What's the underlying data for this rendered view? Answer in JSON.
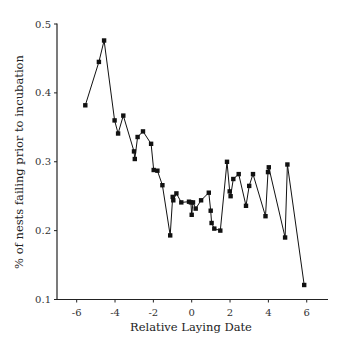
{
  "chart_data": {
    "type": "line",
    "title": "",
    "xlabel": "Relative Laying Date",
    "ylabel": "% of nests failing prior to incubation",
    "xlim": [
      -7,
      7
    ],
    "ylim": [
      0.1,
      0.5
    ],
    "xticks": [
      -6,
      -4,
      -2,
      0,
      2,
      4,
      6
    ],
    "xtick_labels": [
      "-6",
      "-4",
      "-2",
      "0",
      "2",
      "4",
      "6"
    ],
    "yticks": [
      0.1,
      0.2,
      0.3,
      0.4,
      0.5
    ],
    "ytick_labels": [
      "0.1",
      "0.2",
      "0.3",
      "0.4",
      "0.5"
    ],
    "grid": false,
    "legend": null,
    "marker": "square",
    "line_color": "#111111",
    "series": [
      {
        "name": "nest failure",
        "x": [
          -5.55,
          -4.84,
          -4.57,
          -4.02,
          -3.84,
          -3.57,
          -3.01,
          -2.97,
          -2.82,
          -2.54,
          -2.12,
          -1.98,
          -1.79,
          -1.53,
          -1.12,
          -0.99,
          -0.96,
          -0.8,
          -0.54,
          -0.14,
          -0.04,
          0.0,
          0.07,
          0.21,
          0.49,
          0.89,
          0.99,
          1.04,
          1.18,
          1.49,
          1.84,
          1.98,
          2.03,
          2.17,
          2.45,
          2.83,
          3.0,
          3.2,
          3.85,
          3.98,
          4.02,
          4.87,
          4.99,
          5.87
        ],
        "y": [
          0.382,
          0.445,
          0.476,
          0.36,
          0.341,
          0.367,
          0.315,
          0.304,
          0.336,
          0.344,
          0.326,
          0.288,
          0.287,
          0.266,
          0.193,
          0.249,
          0.244,
          0.254,
          0.241,
          0.242,
          0.241,
          0.223,
          0.241,
          0.232,
          0.244,
          0.255,
          0.229,
          0.211,
          0.203,
          0.2,
          0.3,
          0.257,
          0.25,
          0.275,
          0.282,
          0.236,
          0.265,
          0.282,
          0.221,
          0.285,
          0.292,
          0.19,
          0.296,
          0.121
        ]
      }
    ]
  }
}
